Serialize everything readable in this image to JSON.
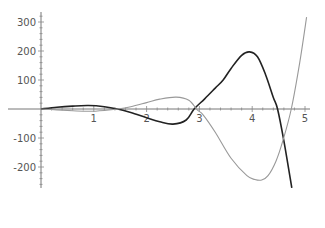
{
  "chart_data": {
    "type": "line",
    "title": "",
    "xlabel": "",
    "ylabel": "",
    "xlim": [
      0,
      5.05
    ],
    "ylim": [
      -270,
      335
    ],
    "grid": false,
    "legend": null,
    "x_ticks": [
      1,
      2,
      3,
      4,
      5
    ],
    "x_tick_labels": [
      "1",
      "2",
      "3",
      "4",
      "5"
    ],
    "y_ticks": [
      300,
      200,
      100,
      -100,
      -200
    ],
    "y_tick_labels": [
      "300",
      "200",
      "100",
      "-100",
      "-200"
    ],
    "series": [
      {
        "name": "dark curve",
        "color": "#222222",
        "stroke_width": 1.6,
        "x": [
          0,
          0.3,
          0.6,
          0.9,
          1.2,
          1.45,
          1.7,
          2.0,
          2.25,
          2.5,
          2.75,
          2.9,
          3.1,
          3.3,
          3.45,
          3.6,
          3.8,
          3.95,
          4.1,
          4.25,
          4.4,
          4.48,
          4.6,
          4.75
        ],
        "y": [
          0,
          6,
          10,
          12,
          8,
          0,
          -12,
          -30,
          -44,
          -52,
          -38,
          0,
          35,
          72,
          100,
          140,
          185,
          197,
          180,
          120,
          40,
          0,
          -110,
          -272
        ]
      },
      {
        "name": "light curve",
        "color": "#999999",
        "stroke_width": 1.1,
        "x": [
          0,
          0.3,
          0.6,
          0.9,
          1.2,
          1.45,
          1.7,
          2.0,
          2.25,
          2.56,
          2.8,
          2.96,
          3.07,
          3.3,
          3.6,
          3.9,
          4.05,
          4.18,
          4.3,
          4.45,
          4.58,
          4.74,
          4.9,
          5.03
        ],
        "y": [
          0,
          -3,
          -6,
          -8,
          -5,
          0,
          8,
          22,
          34,
          41,
          30,
          -3,
          -20,
          -80,
          -170,
          -230,
          -243,
          -245,
          -230,
          -180,
          -110,
          0,
          160,
          317
        ]
      }
    ]
  }
}
